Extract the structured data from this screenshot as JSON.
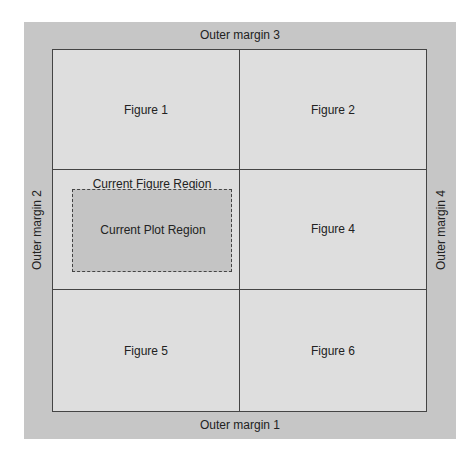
{
  "diagram": {
    "outer_margins": {
      "top": "Outer margin 3",
      "bottom": "Outer margin 1",
      "left": "Outer margin 2",
      "right": "Outer margin 4"
    },
    "figures": [
      {
        "label": "Figure 1"
      },
      {
        "label": "Figure 2"
      },
      {
        "label": "Current Figure Region",
        "plot_label": "Current Plot Region"
      },
      {
        "label": "Figure 4"
      },
      {
        "label": "Figure 5"
      },
      {
        "label": "Figure 6"
      }
    ],
    "layout": {
      "rows": 3,
      "cols": 2
    },
    "colors": {
      "outer_margin": "#c6c6c6",
      "figure_region": "#dedede",
      "plot_region": "#c4c4c4",
      "lines": "#444444"
    }
  }
}
